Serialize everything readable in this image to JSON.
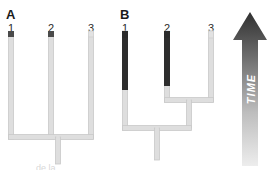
{
  "figure": {
    "width": 273,
    "height": 170,
    "background": "#ffffff",
    "caption_fragment": "de la"
  },
  "colors": {
    "dark_branch": "#2e2e2e",
    "light_branch": "#d7d7d7",
    "light_branch_edge": "#c4c4c4",
    "tip_marker_dark": "#4a4a4a",
    "tip_marker_light": "#dcdcdc",
    "label_text": "#1a1a1a",
    "tip_text": "#2b2b2b",
    "arrow_top": "#3a3a3a",
    "arrow_bottom": "#e2e2e2",
    "arrow_text": "#ffffff"
  },
  "panels": [
    {
      "id": "panel-a",
      "label": "A",
      "label_x": 6,
      "label_y": 8,
      "topology": "polytomy",
      "tips": [
        {
          "id": "a-tip-1",
          "label": "1",
          "x": 11,
          "label_x": 5,
          "label_y": 23,
          "marker": "dark",
          "marker_y": 31,
          "branch_top": 38,
          "branch_bottom": 137
        },
        {
          "id": "a-tip-2",
          "label": "2",
          "x": 51,
          "label_x": 45,
          "label_y": 23,
          "marker": "dark",
          "marker_y": 31,
          "branch_top": 38,
          "branch_bottom": 137
        },
        {
          "id": "a-tip-3",
          "label": "3",
          "x": 91,
          "label_x": 85,
          "label_y": 23,
          "marker": "light",
          "marker_y": 31,
          "branch_top": 38,
          "branch_bottom": 137
        }
      ],
      "node_bar": {
        "y": 137,
        "x1": 11,
        "x2": 91
      },
      "root_stem": {
        "x": 58,
        "y1": 137,
        "y2": 164
      }
    },
    {
      "id": "panel-b",
      "label": "B",
      "label_x": 120,
      "label_y": 8,
      "topology": "resolved",
      "tips": [
        {
          "id": "b-tip-1",
          "label": "1",
          "x": 125,
          "label_x": 119,
          "label_y": 23,
          "marker": "dark",
          "marker_y": 31,
          "branch_top": 31,
          "dark_end": 90,
          "branch_bottom": 128
        },
        {
          "id": "b-tip-2",
          "label": "2",
          "x": 167,
          "label_x": 161,
          "label_y": 23,
          "marker": "dark",
          "marker_y": 31,
          "branch_top": 31,
          "dark_end": 86,
          "branch_bottom": 100
        },
        {
          "id": "b-tip-3",
          "label": "3",
          "x": 211,
          "label_x": 205,
          "label_y": 23,
          "marker": "light",
          "marker_y": 31,
          "branch_top": 31,
          "dark_end": 31,
          "branch_bottom": 100
        }
      ],
      "inner_node_bar": {
        "y": 100,
        "x1": 167,
        "x2": 211
      },
      "inner_stem": {
        "x": 189,
        "y1": 100,
        "y2": 128
      },
      "root_bar": {
        "y": 128,
        "x1": 125,
        "x2": 189
      },
      "root_stem": {
        "x": 157,
        "y1": 128,
        "y2": 160
      }
    }
  ],
  "time_axis": {
    "label": "TIME",
    "direction": "upward",
    "orientation": "vertical",
    "text_rotation_deg": -90
  }
}
